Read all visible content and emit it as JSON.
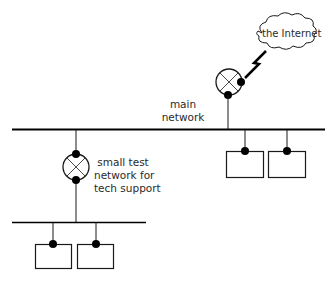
{
  "diagram": {
    "type": "network-topology",
    "colors": {
      "line": "#1a1a1a",
      "background": "#ffffff"
    },
    "labels": {
      "internet": "the Internet",
      "main_network_line1": "main",
      "main_network_line2": "network",
      "test_network_line1": "small test",
      "test_network_line2": "network for",
      "test_network_line3": "tech support"
    },
    "nodes": [
      {
        "id": "internet",
        "kind": "cloud",
        "label": "the Internet"
      },
      {
        "id": "router-main",
        "kind": "router",
        "connects": [
          "internet",
          "main-network"
        ]
      },
      {
        "id": "main-network",
        "kind": "bus",
        "label": "main network"
      },
      {
        "id": "host-main-1",
        "kind": "host",
        "network": "main-network"
      },
      {
        "id": "host-main-2",
        "kind": "host",
        "network": "main-network"
      },
      {
        "id": "router-test",
        "kind": "router",
        "connects": [
          "main-network",
          "test-network"
        ]
      },
      {
        "id": "test-network",
        "kind": "bus",
        "label": "small test network for tech support"
      },
      {
        "id": "host-test-1",
        "kind": "host",
        "network": "test-network"
      },
      {
        "id": "host-test-2",
        "kind": "host",
        "network": "test-network"
      }
    ]
  }
}
